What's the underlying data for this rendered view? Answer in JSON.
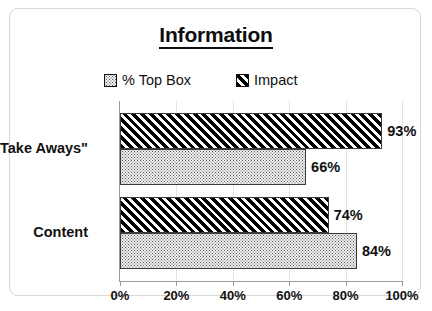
{
  "chart_data": {
    "type": "bar",
    "orientation": "horizontal",
    "title": "Information",
    "xlabel": "",
    "ylabel": "",
    "xlim": [
      0,
      100
    ],
    "xticks": [
      "0%",
      "20%",
      "40%",
      "60%",
      "80%",
      "100%"
    ],
    "xtick_values": [
      0,
      20,
      40,
      60,
      80,
      100
    ],
    "grid": true,
    "legend_position": "top-center",
    "categories": [
      "\"Take Aways\"",
      "Content"
    ],
    "series": [
      {
        "name": "% Top Box",
        "values": [
          66,
          84
        ],
        "labels": [
          "66%",
          "84%"
        ],
        "fill": "stipple"
      },
      {
        "name": "Impact",
        "values": [
          93,
          74
        ],
        "labels": [
          "93%",
          "74%"
        ],
        "fill": "diagonal-hatch"
      }
    ],
    "colors": {
      "top_box_fill": "#f0f0f0",
      "top_box_dot": "#5a5a5a",
      "impact_fill": "#000000",
      "bar_border": "#3a3a3a",
      "axis": "#9a9a9a",
      "gridline": "#e2e2e2",
      "text": "#111111",
      "frame_border": "#d8d8d8",
      "background": "#ffffff"
    }
  },
  "legend": {
    "items": [
      {
        "label": "% Top Box",
        "swatch": "stipple-swatch-icon"
      },
      {
        "label": "Impact",
        "swatch": "hatch-swatch-icon"
      }
    ]
  }
}
